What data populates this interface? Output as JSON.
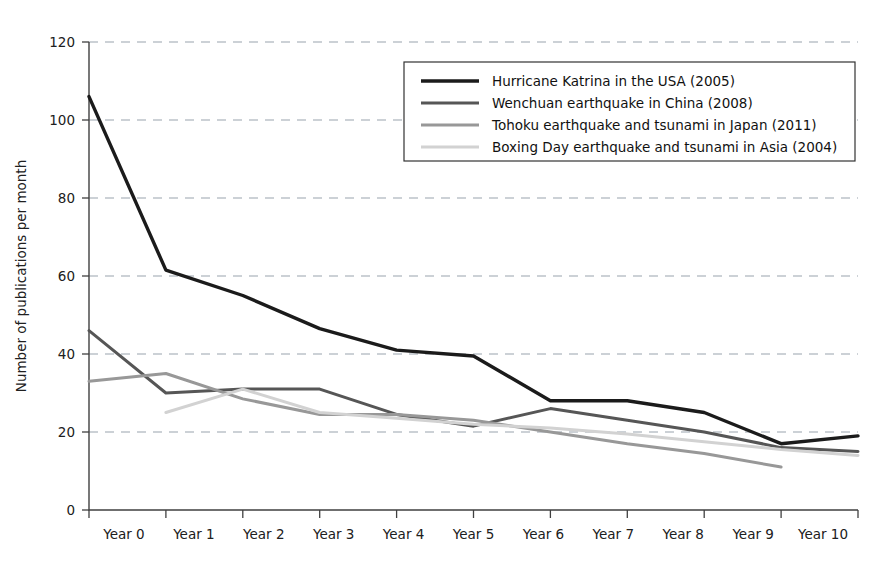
{
  "chart_data": {
    "type": "line",
    "title": "",
    "xlabel": "",
    "ylabel": "Number of publications per month",
    "categories": [
      "Year 0",
      "Year 1",
      "Year 2",
      "Year 3",
      "Year 4",
      "Year 5",
      "Year 6",
      "Year 7",
      "Year 8",
      "Year 9",
      "Year 10"
    ],
    "x_tick_labels": [
      "Year 0",
      "Year 1",
      "Year 2",
      "Year 3",
      "Year 4",
      "Year 5",
      "Year 6",
      "Year 7",
      "Year 8",
      "Year 9",
      "Year 10"
    ],
    "y_tick_labels": [
      "0",
      "20",
      "40",
      "60",
      "80",
      "100",
      "120"
    ],
    "y_ticks": [
      0,
      20,
      40,
      60,
      80,
      100,
      120
    ],
    "ylim": [
      0,
      120
    ],
    "xlim": [
      0,
      10
    ],
    "grid": "horizontal-dashed",
    "legend_position": "top-right",
    "series": [
      {
        "name": "Hurricane Katrina in the USA (2005)",
        "color": "#1b1b1b",
        "width": 3.4,
        "x": [
          0,
          1,
          2,
          3,
          4,
          5,
          6,
          7,
          8,
          9,
          10
        ],
        "values": [
          106,
          61.5,
          55,
          46.5,
          41,
          39.5,
          28,
          28,
          25,
          17,
          19
        ]
      },
      {
        "name": "Wenchuan earthquake in China (2008)",
        "color": "#565656",
        "width": 3.0,
        "x": [
          0,
          1,
          2,
          3,
          4,
          5,
          6,
          7,
          8,
          9,
          10
        ],
        "values": [
          46,
          30,
          31,
          31,
          24.5,
          21.5,
          26,
          23,
          20,
          16,
          15
        ]
      },
      {
        "name": "Tohoku earthquake and tsunami in Japan (2011)",
        "color": "#989898",
        "width": 3.0,
        "x": [
          0,
          1,
          2,
          3,
          4,
          5,
          6,
          7,
          8,
          9
        ],
        "values": [
          33,
          35,
          28.5,
          24.5,
          24.5,
          23,
          20,
          17,
          14.5,
          11
        ]
      },
      {
        "name": "Boxing Day earthquake and tsunami in Asia (2004)",
        "color": "#d2d2d2",
        "width": 3.0,
        "x": [
          1,
          2,
          3,
          4,
          5,
          6,
          7,
          8,
          9,
          10
        ],
        "values": [
          25,
          31,
          25,
          23.5,
          22,
          21,
          19.5,
          17.5,
          15.5,
          14
        ]
      }
    ]
  },
  "legend": {
    "entries": [
      "Hurricane Katrina in the USA (2005)",
      "Wenchuan earthquake in China (2008)",
      "Tohoku earthquake and tsunami in Japan (2011)",
      "Boxing Day earthquake and tsunami in Asia (2004)"
    ]
  },
  "colors": {
    "katrina": "#1b1b1b",
    "wenchuan": "#565656",
    "tohoku": "#989898",
    "boxing_day": "#d2d2d2",
    "axis": "#404040",
    "grid": "#9aa3ad",
    "background": "#ffffff"
  }
}
